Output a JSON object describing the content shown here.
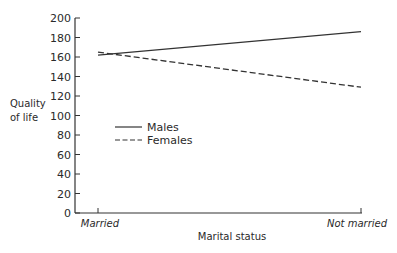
{
  "chart_data": {
    "type": "line",
    "title": "",
    "xlabel": "Marital status",
    "ylabel": "Quality of life",
    "ylabel_lines": [
      "Quality",
      "of life"
    ],
    "categories": [
      "Married",
      "Not married"
    ],
    "series": [
      {
        "name": "Males",
        "style": "solid",
        "values": [
          162,
          186
        ]
      },
      {
        "name": "Females",
        "style": "dashed",
        "values": [
          165,
          129
        ]
      }
    ],
    "ylim": [
      0,
      200
    ],
    "yticks": [
      0,
      20,
      40,
      60,
      80,
      100,
      120,
      140,
      160,
      180,
      200
    ],
    "grid": false,
    "legend_position": "inside-left-center",
    "colors": {
      "line": "#333333",
      "axis": "#333333"
    }
  }
}
